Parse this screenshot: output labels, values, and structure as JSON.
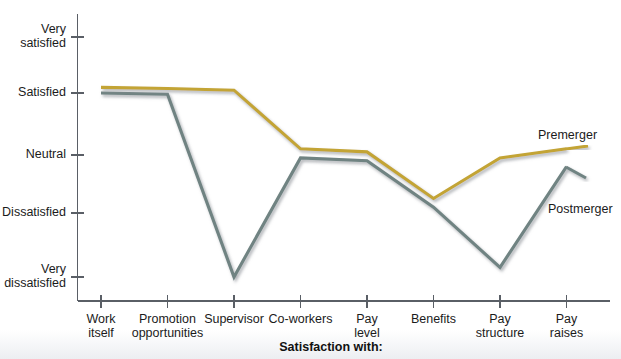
{
  "chart_data": {
    "type": "line",
    "title": "",
    "xlabel": "Satisfaction with:",
    "ylabel": "",
    "grid": false,
    "legend_position": "inline-right",
    "categories": [
      "Work itself",
      "Promotion opportunities",
      "Supervisor",
      "Co-workers",
      "Pay level",
      "Benefits",
      "Pay structure",
      "Pay raises"
    ],
    "y_tick_labels": [
      "Very satisfied",
      "Satisfied",
      "Neutral",
      "Dissatisfied",
      "Very dissatisfied"
    ],
    "y_scale": {
      "Very satisfied": 5,
      "Satisfied": 4,
      "Neutral": 3,
      "Dissatisfied": 2,
      "Very dissatisfied": 1
    },
    "ylim": [
      1,
      5
    ],
    "series": [
      {
        "name": "Premerger",
        "color": "#c3a434",
        "values": [
          4.1,
          4.08,
          4.05,
          3.1,
          3.05,
          2.25,
          2.95,
          3.1
        ]
      },
      {
        "name": "Postmerger",
        "color": "#6f8382",
        "values": [
          4.0,
          3.98,
          1.0,
          2.95,
          2.9,
          2.1,
          1.15,
          2.8
        ]
      }
    ]
  },
  "axis": {
    "x_tick_positions_px": [
      101,
      167.5,
      234,
      300.5,
      367,
      433.5,
      500,
      566.5
    ],
    "y_tick_positions_px": {
      "Very satisfied": 37,
      "Satisfied": 93,
      "Neutral": 155,
      "Dissatisfied": 213,
      "Very dissatisfied": 277
    },
    "x_axis_label": "Satisfaction with:",
    "tick_labels_x": [
      {
        "line1": "Work",
        "line2": "itself"
      },
      {
        "line1": "Promotion",
        "line2": "opportunities"
      },
      {
        "line1": "Supervisor",
        "line2": ""
      },
      {
        "line1": "Co-workers",
        "line2": ""
      },
      {
        "line1": "Pay",
        "line2": "level"
      },
      {
        "line1": "Benefits",
        "line2": ""
      },
      {
        "line1": "Pay",
        "line2": "structure"
      },
      {
        "line1": "Pay",
        "line2": "raises"
      }
    ],
    "tick_labels_y": [
      {
        "line1": "Very",
        "line2": "satisfied"
      },
      {
        "line1": "Satisfied",
        "line2": ""
      },
      {
        "line1": "Neutral",
        "line2": ""
      },
      {
        "line1": "Dissatisfied",
        "line2": ""
      },
      {
        "line1": "Very",
        "line2": "dissatisfied"
      }
    ]
  },
  "legend": {
    "premerger_label": "Premerger",
    "postmerger_label": "Postmerger"
  },
  "colors": {
    "premerger": "#c3a434",
    "postmerger": "#6f8382",
    "axis": "#5a5f66",
    "text": "#1b1b1b"
  }
}
